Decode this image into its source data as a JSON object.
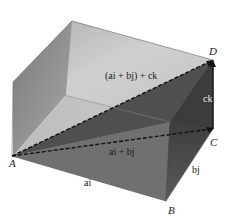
{
  "diagram": {
    "type": "3d-box-vector-diagram",
    "points": {
      "A": "A",
      "B": "B",
      "C": "C",
      "D": "D"
    },
    "vectors": {
      "ai": "ai",
      "bj": "bj",
      "ck": "ck",
      "ai_plus_bj": "ai + bj",
      "diagonal": "(ai + bj) + ck"
    },
    "colors": {
      "top_face": "#cfcfcf",
      "left_inner_face": "#9a9a9a",
      "back_face": "#bdbdbd",
      "front_face": "#6e6e6e",
      "right_face": "#555555",
      "dark_triangle": "#4a4a4a",
      "dashed_line": "#111111"
    }
  }
}
